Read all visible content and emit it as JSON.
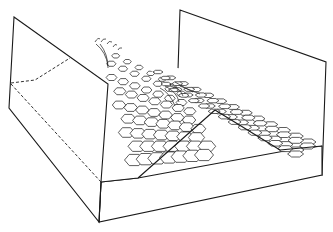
{
  "figure": {
    "caption": "",
    "colors": {
      "line": "#1a1a1a",
      "background": "#ffffff"
    }
  }
}
